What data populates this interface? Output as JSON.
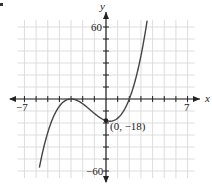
{
  "chart_data": {
    "type": "line",
    "title": "",
    "xlabel": "x",
    "ylabel": "y",
    "xlim": [
      -7,
      7
    ],
    "ylim": [
      -60,
      60
    ],
    "x_ticks_labeled": [
      "-7",
      "7"
    ],
    "y_ticks_labeled": [
      "60",
      "-60"
    ],
    "x_tick_step": 1,
    "y_tick_step": 10,
    "grid": true,
    "function": "f(x) = (x + 3)^2 (x - 2)",
    "series": [
      {
        "name": "f(x)",
        "x": [
          -5.7,
          -5,
          -4,
          -3,
          -2,
          -1,
          0,
          1,
          2,
          3,
          3.5
        ],
        "y": [
          -56.1,
          -28,
          -6,
          0,
          -4,
          -12,
          -18,
          -16,
          0,
          36,
          63.4
        ]
      }
    ],
    "annotations": [
      {
        "label": "(0, −18)",
        "x": 0,
        "y": -18
      }
    ]
  },
  "labels": {
    "x_axis": "x",
    "y_axis": "y",
    "x_min": "−7",
    "x_max": "7",
    "y_max": "60",
    "y_min": "−60",
    "point": "(0, −18)"
  },
  "colors": {
    "grid": "#d4d4d4",
    "axis": "#222222",
    "curve": "#444444"
  }
}
